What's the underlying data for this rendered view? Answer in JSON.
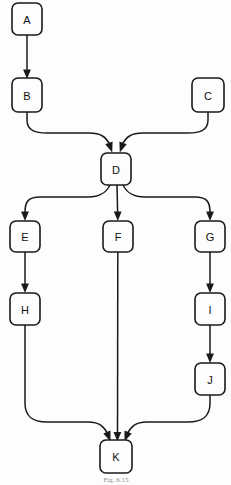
{
  "figure": {
    "caption": "Fig. 6.15",
    "background_color": "#fdfdfd",
    "line_color": "#1a1a1a",
    "node_fill": "#fdfdfd"
  },
  "diagram": {
    "type": "flowchart",
    "nodes": [
      {
        "id": "A",
        "label": "A",
        "cx": 27,
        "cy": 19,
        "w": 30,
        "h": 32
      },
      {
        "id": "B",
        "label": "B",
        "cx": 27,
        "cy": 95,
        "w": 30,
        "h": 34
      },
      {
        "id": "C",
        "label": "C",
        "cx": 208,
        "cy": 95,
        "w": 32,
        "h": 34
      },
      {
        "id": "D",
        "label": "D",
        "cx": 116,
        "cy": 169,
        "w": 30,
        "h": 32
      },
      {
        "id": "E",
        "label": "E",
        "cx": 25,
        "cy": 237,
        "w": 30,
        "h": 31
      },
      {
        "id": "F",
        "label": "F",
        "cx": 118,
        "cy": 237,
        "w": 30,
        "h": 31
      },
      {
        "id": "G",
        "label": "G",
        "cx": 210,
        "cy": 237,
        "w": 30,
        "h": 31
      },
      {
        "id": "H",
        "label": "H",
        "cx": 25,
        "cy": 309,
        "w": 30,
        "h": 32
      },
      {
        "id": "I",
        "label": "I",
        "cx": 210,
        "cy": 309,
        "w": 30,
        "h": 32
      },
      {
        "id": "J",
        "label": "J",
        "cx": 210,
        "cy": 379,
        "w": 30,
        "h": 32
      },
      {
        "id": "K",
        "label": "K",
        "cx": 116,
        "cy": 456,
        "w": 32,
        "h": 33
      }
    ],
    "edges": [
      {
        "from": "A",
        "to": "B",
        "shape": "straight"
      },
      {
        "from": "B",
        "to": "D",
        "shape": "curve-right"
      },
      {
        "from": "C",
        "to": "D",
        "shape": "curve-left"
      },
      {
        "from": "D",
        "to": "E",
        "shape": "curve-left"
      },
      {
        "from": "D",
        "to": "F",
        "shape": "straight"
      },
      {
        "from": "D",
        "to": "G",
        "shape": "curve-right"
      },
      {
        "from": "E",
        "to": "H",
        "shape": "straight"
      },
      {
        "from": "G",
        "to": "I",
        "shape": "straight"
      },
      {
        "from": "I",
        "to": "J",
        "shape": "straight"
      },
      {
        "from": "H",
        "to": "K",
        "shape": "curve-right"
      },
      {
        "from": "F",
        "to": "K",
        "shape": "straight"
      },
      {
        "from": "J",
        "to": "K",
        "shape": "curve-left"
      }
    ]
  }
}
